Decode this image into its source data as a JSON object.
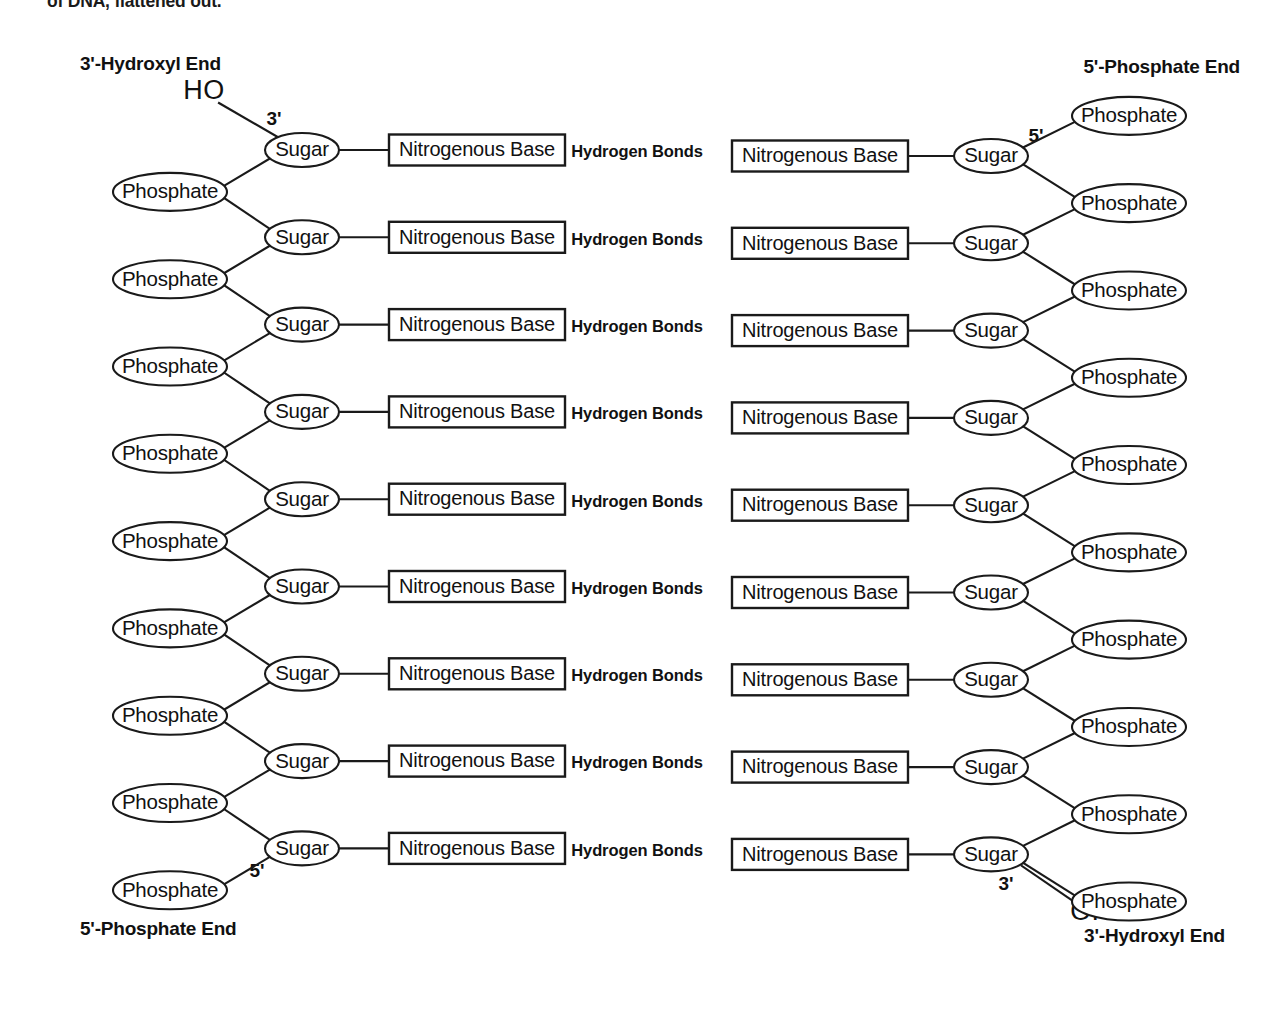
{
  "figure": {
    "caption_clipped": "of DNA, flattened out.",
    "background_color": "#ffffff",
    "ink_color": "#1a1a1a"
  },
  "labels": {
    "top_left_end": "3'-Hydroxyl End",
    "top_right_end": "5'-Phosphate End",
    "bottom_left_end": "5'-Phosphate End",
    "bottom_right_end": "3'-Hydroxyl End",
    "hydroxyl_top": "HO",
    "hydroxyl_bottom": "OH",
    "prime_top_left": "3'",
    "prime_bottom_left": "5'",
    "prime_top_right": "5'",
    "prime_bottom_right": "3'"
  },
  "nodes": {
    "sugar": "Sugar",
    "phosphate": "Phosphate",
    "base": "Nitrogenous Base",
    "hydrogen_bonds": "Hydrogen Bonds"
  },
  "chart_data": {
    "type": "diagram",
    "rungs": 9,
    "left_strand": {
      "direction": "3' to 5' top-to-bottom",
      "sugar_count": 9,
      "phosphate_count": 9,
      "base_count": 9,
      "terminal_top": "HO (3'-hydroxyl)",
      "terminal_bottom": "Phosphate (5'-phosphate)"
    },
    "right_strand": {
      "direction": "5' to 3' top-to-bottom",
      "sugar_count": 9,
      "phosphate_count": 9,
      "base_count": 9,
      "terminal_top": "Phosphate (5'-phosphate)",
      "terminal_bottom": "OH (3'-hydroxyl)"
    },
    "hydrogen_bond_labels": 9
  },
  "geometry": {
    "left_sugar_x": 302,
    "left_phosphate_x": 170,
    "left_base_cx": 477,
    "right_sugar_x": 991,
    "right_phosphate_x": 1129,
    "right_base_cx": 820,
    "hbond_x": 637,
    "row_start_y": 150,
    "row_step": 87.3,
    "sugar_rx": 37,
    "sugar_ry": 17,
    "phosphate_rx": 57,
    "phosphate_ry": 19,
    "base_w": 176,
    "base_h": 31
  }
}
